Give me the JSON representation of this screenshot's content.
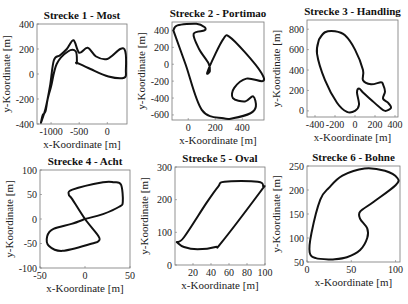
{
  "figure": {
    "xlabel": "x-Koordinate [m]",
    "ylabel": "y-Koordinate [m]"
  },
  "chart_data": [
    {
      "type": "line",
      "title": "Strecke 1 - Most",
      "xlabel": "x-Koordinate [m]",
      "ylabel": "y-Koordinate [m]",
      "xlim": [
        -1250,
        350
      ],
      "ylim": [
        -400,
        400
      ],
      "xticks": [
        "-1000",
        "-500",
        "0"
      ],
      "yticks": [
        "400",
        "200",
        "0",
        "-200",
        "-400"
      ],
      "box": [
        37,
        24,
        127,
        124
      ],
      "x": [
        -1180,
        -1150,
        -1100,
        -1060,
        -1000,
        -900,
        -700,
        -560,
        -540,
        -540,
        -300,
        20,
        300,
        330,
        320,
        230,
        0,
        -200,
        -350,
        -500,
        -600,
        -720,
        -840,
        -950,
        -1020,
        -1100,
        -1180
      ],
      "y": [
        -390,
        -330,
        -300,
        -200,
        -100,
        80,
        180,
        180,
        90,
        90,
        40,
        -20,
        -30,
        30,
        180,
        200,
        120,
        140,
        210,
        170,
        270,
        200,
        150,
        110,
        -100,
        -280,
        -390
      ]
    },
    {
      "type": "line",
      "title": "Strecke 2 - Portimao",
      "xlabel": "x-Koordinate [m]",
      "ylabel": "y-Koordinate [m]",
      "xlim": [
        -120,
        560
      ],
      "ylim": [
        -660,
        500
      ],
      "xticks": [
        "0",
        "200",
        "400"
      ],
      "yticks": [
        "400",
        "200",
        "0",
        "-200",
        "-400",
        "-600"
      ],
      "box": [
        172,
        22,
        264,
        120
      ],
      "x": [
        -110,
        -80,
        60,
        120,
        120,
        40,
        80,
        150,
        160,
        140,
        200,
        260,
        300,
        420,
        540,
        550,
        430,
        340,
        330,
        420,
        480,
        500,
        460,
        330,
        260,
        100,
        -20,
        -110
      ],
      "y": [
        400,
        460,
        480,
        440,
        400,
        360,
        180,
        10,
        -80,
        -100,
        120,
        300,
        330,
        140,
        -100,
        -200,
        -170,
        -280,
        -400,
        -440,
        -380,
        -500,
        -580,
        -640,
        -640,
        -540,
        0,
        400
      ]
    },
    {
      "type": "line",
      "title": "Strecke 3 - Handling",
      "xlabel": "x-Koordinate [m]",
      "ylabel": "y-Koordinate [m]",
      "xlim": [
        -480,
        430
      ],
      "ylim": [
        -60,
        890
      ],
      "xticks": [
        "-400",
        "-200",
        "0",
        "200",
        "400"
      ],
      "yticks": [
        "800",
        "600",
        "400",
        "200",
        "0"
      ],
      "box": [
        307,
        20,
        398,
        117
      ],
      "x": [
        -360,
        -300,
        -200,
        -100,
        0,
        80,
        80,
        160,
        260,
        280,
        300,
        280,
        330,
        360,
        300,
        240,
        160,
        80,
        40,
        20,
        40,
        0,
        -80,
        -180,
        -300,
        -380,
        -360
      ],
      "y": [
        700,
        770,
        780,
        740,
        600,
        400,
        300,
        260,
        280,
        260,
        190,
        120,
        80,
        30,
        0,
        40,
        110,
        180,
        220,
        180,
        60,
        0,
        -10,
        80,
        300,
        560,
        700
      ]
    },
    {
      "type": "line",
      "title": "Strecke 4 - Acht",
      "xlabel": "x-Koordinate [m]",
      "ylabel": "y-Koordinate [m]",
      "xlim": [
        -50,
        50
      ],
      "ylim": [
        -100,
        100
      ],
      "xticks": [
        "-50",
        "0",
        "50"
      ],
      "yticks": [
        "100",
        "50",
        "0",
        "-50",
        "-100"
      ],
      "box": [
        40,
        170,
        130,
        268
      ],
      "x": [
        0,
        20,
        38,
        42,
        40,
        32,
        20,
        -14,
        -18,
        -14,
        0,
        15,
        15,
        8,
        -25,
        -40,
        -42,
        -35,
        -15,
        0
      ],
      "y": [
        0,
        10,
        25,
        35,
        70,
        75,
        75,
        60,
        50,
        40,
        0,
        -35,
        -45,
        -50,
        -65,
        -55,
        -35,
        -20,
        -10,
        0
      ],
      "note": "figure-eight track"
    },
    {
      "type": "line",
      "title": "Strecke 5 - Oval",
      "xlabel": "x-Koordinate [m]",
      "ylabel": "y-Koordinate [m]",
      "xlim": [
        0,
        100
      ],
      "ylim": [
        0,
        300
      ],
      "xticks": [
        "20",
        "40",
        "60",
        "80",
        "100"
      ],
      "yticks": [
        "300",
        "200",
        "100",
        "0"
      ],
      "box": [
        175,
        167,
        265,
        265
      ],
      "x": [
        2,
        10,
        25,
        45,
        52,
        95,
        98,
        92,
        55,
        48,
        35,
        10,
        2
      ],
      "y": [
        70,
        55,
        48,
        55,
        70,
        225,
        240,
        255,
        255,
        240,
        190,
        85,
        70
      ]
    },
    {
      "type": "line",
      "title": "Strecke 6 - Bohne",
      "xlabel": "x-Koordinate [m]",
      "ylabel": "y-Koordinate [m]",
      "xlim": [
        0,
        105
      ],
      "ylim": [
        50,
        250
      ],
      "xticks": [
        "0",
        "50",
        "100"
      ],
      "yticks": [
        "250",
        "200",
        "150",
        "100",
        "50"
      ],
      "box": [
        307,
        166,
        400,
        262
      ],
      "x": [
        28,
        45,
        60,
        68,
        68,
        60,
        60,
        75,
        100,
        102,
        88,
        65,
        40,
        25,
        15,
        5,
        3,
        10,
        28
      ],
      "y": [
        55,
        60,
        75,
        100,
        120,
        140,
        155,
        175,
        210,
        225,
        240,
        245,
        230,
        205,
        180,
        110,
        70,
        58,
        55
      ]
    }
  ]
}
